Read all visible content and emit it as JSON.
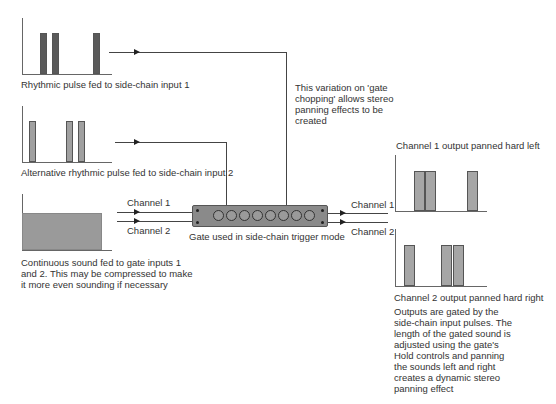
{
  "colors": {
    "dark_bar": "#5a5a5a",
    "mid_bar": "#a0a0a0",
    "continuous_block": "#9a9a9a",
    "output_bar": "#a6a6a6",
    "gate_body": "#8a8a8a",
    "line": "#444444"
  },
  "diagram": {
    "input1": {
      "caption": "Rhythmic pulse fed to side-chain input 1",
      "pulses": [
        {
          "x": 40,
          "w": 6
        },
        {
          "x": 52,
          "w": 6
        },
        {
          "x": 93,
          "w": 6
        }
      ]
    },
    "input2": {
      "caption": "Alternative rhythmic pulse fed to side-chain input 2",
      "pulses": [
        {
          "x": 29,
          "w": 6
        },
        {
          "x": 66,
          "w": 6
        },
        {
          "x": 78,
          "w": 6
        }
      ]
    },
    "continuous": {
      "caption": "Continuous sound fed to gate inputs 1 and 2. This may be compressed to make it more even sounding if necessary"
    },
    "gate": {
      "caption": "Gate used in side-chain trigger mode",
      "knob_count": 8
    },
    "input_channels": {
      "ch1": "Channel 1",
      "ch2": "Channel 2"
    },
    "output_channels": {
      "ch1": "Channel 1",
      "ch2": "Channel 2"
    },
    "note": "This variation on 'gate chopping' allows stereo panning effects to be created",
    "output1": {
      "caption": "Channel 1 output panned hard left",
      "pulses": [
        {
          "x": 414,
          "w": 11
        },
        {
          "x": 425,
          "w": 11
        },
        {
          "x": 467,
          "w": 11
        }
      ]
    },
    "output2": {
      "caption": "Channel 2 output panned hard right",
      "pulses": [
        {
          "x": 404,
          "w": 11
        },
        {
          "x": 441,
          "w": 11
        },
        {
          "x": 453,
          "w": 11
        }
      ]
    },
    "explanation": "Outputs are gated by the side-chain input pulses. The length of the gated sound is adjusted using the gate's Hold controls and panning the sounds left and right creates a dynamic stereo panning effect"
  }
}
